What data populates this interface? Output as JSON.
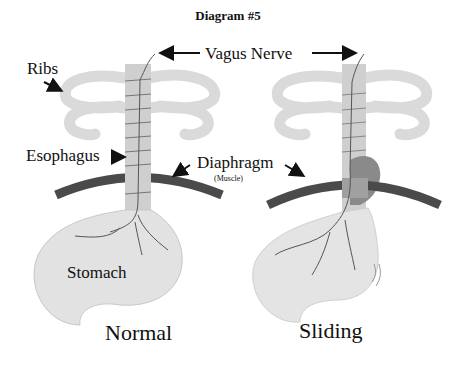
{
  "title": "Diagram #5",
  "labels": {
    "ribs": "Ribs",
    "vagus_nerve": "Vagus Nerve",
    "esophagus": "Esophagus",
    "diaphragm": "Diaphragm",
    "diaphragm_note": "(Muscle)",
    "stomach": "Stomach"
  },
  "panels": [
    {
      "caption": "Normal"
    },
    {
      "caption": "Sliding"
    }
  ],
  "colors": {
    "ribs": "#d8d8d8",
    "esophagus": "#cfcfcf",
    "diaphragm": "#4a4a4a",
    "stomach": "#e2e2e2",
    "hernia": "#8a8a8a",
    "nerve": "#555555",
    "text": "#111111"
  }
}
